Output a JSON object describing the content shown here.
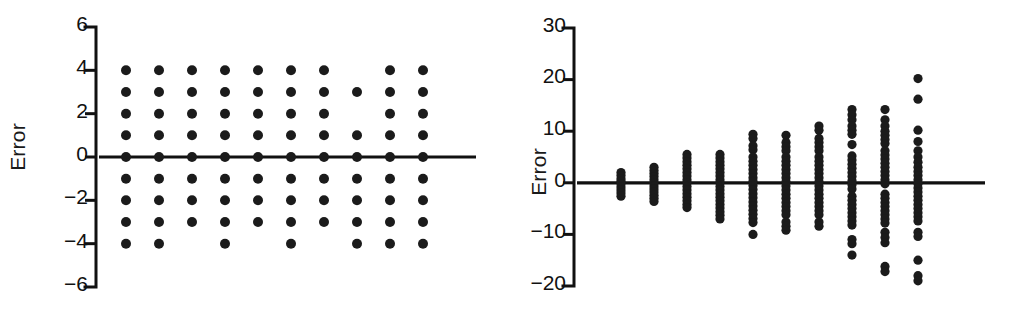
{
  "figure": {
    "background": "#ffffff",
    "ink_color": "#1b1b1b",
    "panel_count": 2
  },
  "chart_data": [
    {
      "type": "scatter",
      "panel": "left",
      "title": "",
      "xlabel": "",
      "ylabel": "Error",
      "grid": false,
      "legend": "none",
      "xlim": [
        0.5,
        10.5
      ],
      "ylim": [
        -6,
        6
      ],
      "yticks": [
        6,
        4,
        2,
        0,
        -2,
        -4,
        -6
      ],
      "ytick_labels": [
        "6",
        "4",
        "2",
        "0",
        "-2",
        "-4",
        "-6"
      ],
      "xticks": [],
      "xtick_labels": [],
      "zero_reference_line": 0,
      "note": "Strip plot: 10 categorical columns, integer-valued errors from -4 to +4",
      "categories": [
        "1",
        "2",
        "3",
        "4",
        "5",
        "6",
        "7",
        "8",
        "9",
        "10"
      ],
      "columns": [
        {
          "x": 1,
          "values": [
            4,
            3,
            2,
            1,
            0,
            -1,
            -2,
            -3,
            -4
          ]
        },
        {
          "x": 2,
          "values": [
            4,
            3,
            2,
            1,
            0,
            -1,
            -2,
            -3,
            -4
          ]
        },
        {
          "x": 3,
          "values": [
            4,
            3,
            2,
            1,
            0,
            -1,
            -2,
            -3
          ]
        },
        {
          "x": 4,
          "values": [
            4,
            3,
            2,
            1,
            0,
            -1,
            -2,
            -3,
            -4
          ]
        },
        {
          "x": 5,
          "values": [
            4,
            3,
            2,
            1,
            0,
            -1,
            -2,
            -3
          ]
        },
        {
          "x": 6,
          "values": [
            4,
            3,
            2,
            1,
            0,
            -1,
            -2,
            -3,
            -4
          ]
        },
        {
          "x": 7,
          "values": [
            4,
            3,
            2,
            1,
            0,
            -1,
            -2,
            -3
          ]
        },
        {
          "x": 8,
          "values": [
            3,
            1,
            0,
            -1,
            -2,
            -3,
            -4
          ]
        },
        {
          "x": 9,
          "values": [
            4,
            3,
            2,
            1,
            0,
            -1,
            -2,
            -3,
            -4
          ]
        },
        {
          "x": 10,
          "values": [
            4,
            3,
            2,
            1,
            0,
            -1,
            -2,
            -3,
            -4
          ]
        }
      ]
    },
    {
      "type": "scatter",
      "panel": "right",
      "title": "",
      "xlabel": "",
      "ylabel": "Error",
      "grid": false,
      "legend": "none",
      "xlim": [
        0.5,
        10.5
      ],
      "ylim": [
        -20,
        30
      ],
      "yticks": [
        30,
        20,
        10,
        0,
        -10,
        -20
      ],
      "ytick_labels": [
        "30",
        "20",
        "10",
        "0",
        "-10",
        "-20"
      ],
      "xticks": [],
      "xtick_labels": [],
      "zero_reference_line": 0,
      "note": "Strip plot: 10 columns, error spread widens (funnel) left to right",
      "categories": [
        "1",
        "2",
        "3",
        "4",
        "5",
        "6",
        "7",
        "8",
        "9",
        "10"
      ],
      "columns": [
        {
          "x": 1,
          "values": [
            2,
            1.4,
            0.8,
            0.3,
            -0.2,
            -0.8,
            -1.4,
            -2,
            -2.6
          ]
        },
        {
          "x": 2,
          "values": [
            3,
            2.4,
            1.8,
            1.2,
            0.6,
            0,
            -0.6,
            -1.2,
            -1.8,
            -2.4,
            -3,
            -3.6
          ]
        },
        {
          "x": 3,
          "values": [
            5.5,
            4.8,
            4.1,
            3.4,
            2.7,
            2,
            1.3,
            0.6,
            0,
            -0.7,
            -1.4,
            -2.1,
            -2.8,
            -3.5,
            -4.2,
            -4.8
          ]
        },
        {
          "x": 4,
          "values": [
            5.5,
            4.8,
            4.1,
            3.4,
            2.7,
            2,
            1.3,
            0.6,
            0,
            -0.7,
            -1.4,
            -2.1,
            -2.8,
            -3.5,
            -4.2,
            -4.9,
            -5.6,
            -6.3,
            -7
          ]
        },
        {
          "x": 5,
          "values": [
            9.4,
            8.6,
            7.2,
            6.4,
            5,
            4.2,
            3.4,
            2.6,
            1.8,
            1,
            0.3,
            -0.5,
            -1.3,
            -2.1,
            -2.9,
            -3.7,
            -4.5,
            -5.3,
            -6.1,
            -6.9,
            -7.7,
            -10
          ]
        },
        {
          "x": 6,
          "values": [
            9.2,
            7.8,
            7,
            6.2,
            5,
            4.2,
            3.4,
            2.6,
            1.8,
            1,
            0.2,
            -0.6,
            -1.4,
            -2.2,
            -3,
            -3.8,
            -4.6,
            -5.4,
            -6.2,
            -7.6,
            -8.4,
            -9.2
          ]
        },
        {
          "x": 7,
          "values": [
            11,
            10.2,
            8.6,
            7.8,
            7,
            6.2,
            5,
            4.2,
            3.4,
            2.6,
            1.8,
            1,
            0.2,
            -0.6,
            -1.4,
            -2.2,
            -3,
            -3.8,
            -4.6,
            -5.4,
            -6.2,
            -7.6,
            -8.4
          ]
        },
        {
          "x": 8,
          "values": [
            14.2,
            13.2,
            12.2,
            11,
            10.2,
            9.4,
            7.4,
            5.2,
            4.4,
            3.6,
            2.8,
            2,
            1.2,
            0.4,
            -0.4,
            -1.2,
            -2.6,
            -3.4,
            -4.2,
            -5,
            -5.8,
            -6.6,
            -7.4,
            -8.2,
            -11,
            -11.8,
            -14
          ]
        },
        {
          "x": 9,
          "values": [
            14.2,
            12.2,
            11,
            10,
            9.2,
            8.4,
            7.6,
            6.2,
            5.4,
            4.6,
            3.8,
            3,
            2.2,
            1.4,
            0.6,
            -0.2,
            -2.2,
            -3,
            -3.8,
            -4.6,
            -5.4,
            -6.2,
            -7,
            -7.8,
            -9.6,
            -10.6,
            -11.6,
            -16.2,
            -17.2
          ]
        },
        {
          "x": 10,
          "values": [
            20.2,
            16.2,
            10.2,
            8,
            6.2,
            5,
            4,
            3,
            2.2,
            1.4,
            0.6,
            -0.2,
            -1,
            -1.8,
            -2.6,
            -3.4,
            -4.2,
            -5,
            -5.8,
            -6.6,
            -7.4,
            -9.6,
            -10.4,
            -15,
            -18,
            -19
          ]
        }
      ]
    }
  ]
}
